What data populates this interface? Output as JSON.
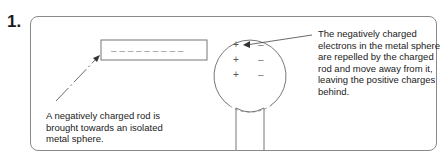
{
  "question": {
    "number": "1.",
    "header_fragment": "..."
  },
  "diagram": {
    "rod": {
      "charge_symbols": "– – – – – – – – –"
    },
    "sphere": {
      "left_charges": [
        "+",
        "+",
        "+"
      ],
      "right_charges": [
        "–",
        "–",
        "–"
      ]
    },
    "labels": {
      "rod_caption": "A negatively charged rod is brought towards an isolated metal sphere.",
      "sphere_caption": "The negatively charged electrons in the metal sphere are repelled by the charged rod and move away from it, leaving the positive charges behind."
    },
    "colors": {
      "line": "#555555",
      "frame": "#8a8a8a",
      "text": "#222222"
    }
  }
}
